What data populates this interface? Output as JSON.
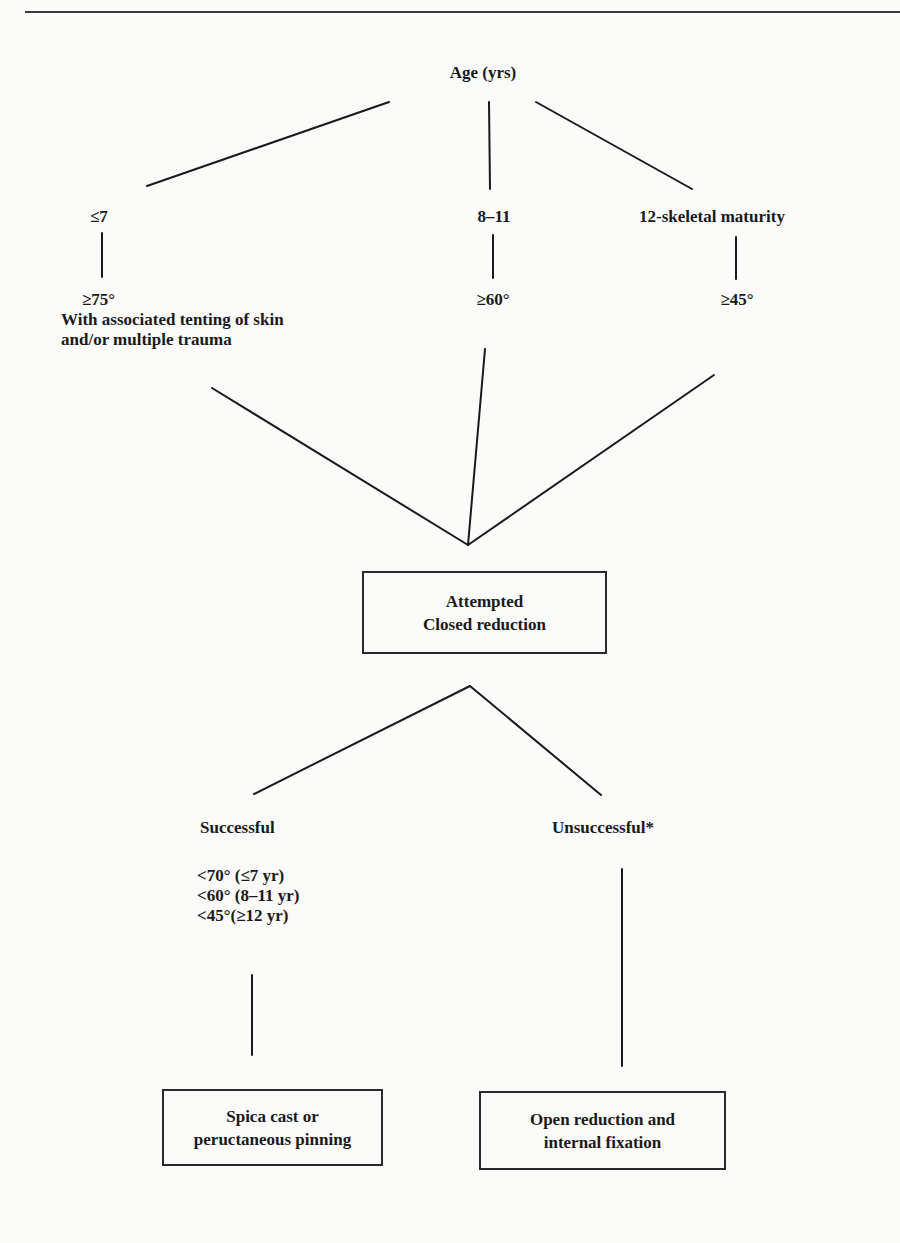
{
  "diagram": {
    "root": {
      "label": "Age (yrs)"
    },
    "age_groups": [
      {
        "age": "≤7",
        "threshold": "≥75°",
        "note_line1": "With associated tenting of skin",
        "note_line2": "and/or multiple trauma"
      },
      {
        "age": "8–11",
        "threshold": "≥60°"
      },
      {
        "age": "12-skeletal maturity",
        "threshold": "≥45°"
      }
    ],
    "decision_box": {
      "line1": "Attempted",
      "line2": "Closed reduction"
    },
    "outcomes": [
      {
        "label": "Successful",
        "criteria": [
          "<70° (≤7 yr)",
          "<60° (8–11 yr)",
          "<45°(≥12 yr)"
        ],
        "treatment_line1": "Spica cast or",
        "treatment_line2": "peructaneous pinning"
      },
      {
        "label": "Unsuccessful*",
        "treatment_line1": "Open reduction and",
        "treatment_line2": "internal fixation"
      }
    ],
    "colors": {
      "line": "#1a1a1a",
      "background": "#fbfbfa"
    }
  }
}
